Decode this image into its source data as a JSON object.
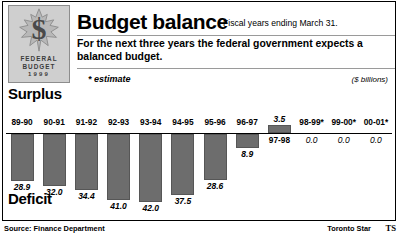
{
  "logo": {
    "symbol": "$",
    "line1": "FEDERAL",
    "line2": "BUDGET",
    "line3": "1999",
    "icon": "maple-leaf-icon"
  },
  "header": {
    "title": "Budget balance",
    "title_note": "Fiscal years ending March 31.",
    "deck": "For the next three years the federal government expects a balanced budget.",
    "estimate_note": "* estimate",
    "units": "($ billions)"
  },
  "chart_labels": {
    "surplus": "Surplus",
    "deficit": "Deficit"
  },
  "footer": {
    "source": "Source: Finance Department",
    "credit": "Toronto Star",
    "credit_mark": "TS"
  },
  "chart_data": {
    "type": "bar",
    "title": "Budget balance",
    "subtitle": "Fiscal years ending March 31.",
    "ylabel": "($ billions)",
    "xlabel": "",
    "categories": [
      "89-90",
      "90-91",
      "91-92",
      "92-93",
      "93-94",
      "94-95",
      "95-96",
      "96-97",
      "97-98",
      "98-99*",
      "99-00*",
      "00-01*"
    ],
    "values": [
      -28.9,
      -32.0,
      -34.4,
      -41.0,
      -42.0,
      -37.5,
      -28.6,
      -8.9,
      3.5,
      0.0,
      0.0,
      0.0
    ],
    "value_labels": [
      "28.9",
      "32.0",
      "34.4",
      "41.0",
      "42.0",
      "37.5",
      "28.6",
      "8.9",
      "3.5",
      "0.0",
      "0.0",
      "0.0"
    ],
    "bars": [
      {
        "year": "89-90",
        "label": "28.9",
        "value": -28.9,
        "sign": "deficit"
      },
      {
        "year": "90-91",
        "label": "32.0",
        "value": -32.0,
        "sign": "deficit"
      },
      {
        "year": "91-92",
        "label": "34.4",
        "value": -34.4,
        "sign": "deficit"
      },
      {
        "year": "92-93",
        "label": "41.0",
        "value": -41.0,
        "sign": "deficit"
      },
      {
        "year": "93-94",
        "label": "42.0",
        "value": -42.0,
        "sign": "deficit"
      },
      {
        "year": "94-95",
        "label": "37.5",
        "value": -37.5,
        "sign": "deficit"
      },
      {
        "year": "95-96",
        "label": "28.6",
        "value": -28.6,
        "sign": "deficit"
      },
      {
        "year": "96-97",
        "label": "8.9",
        "value": -8.9,
        "sign": "deficit"
      },
      {
        "year": "97-98",
        "label": "3.5",
        "value": 3.5,
        "sign": "surplus"
      },
      {
        "year": "98-99*",
        "label": "0.0",
        "value": 0.0,
        "sign": "zero"
      },
      {
        "year": "99-00*",
        "label": "0.0",
        "value": 0.0,
        "sign": "zero"
      },
      {
        "year": "00-01*",
        "label": "0.0",
        "value": 0.0,
        "sign": "zero"
      }
    ],
    "grid": false,
    "legend": "none",
    "colors": {
      "bar": "#6d6d6d",
      "axis": "#000000",
      "plate": "#cfcfcf"
    }
  }
}
